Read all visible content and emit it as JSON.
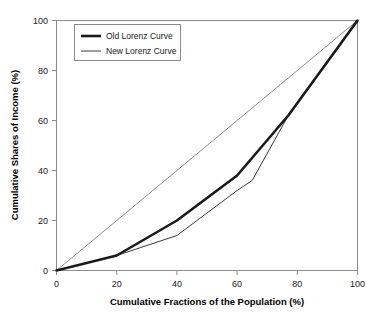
{
  "chart_data": {
    "type": "line",
    "title": "",
    "xlabel": "Cumulative Fractions of the Population (%)",
    "ylabel": "Cumulative Shares of Income (%)",
    "xlim": [
      0,
      100
    ],
    "ylim": [
      0,
      100
    ],
    "xticks": [
      0,
      20,
      40,
      60,
      80,
      100
    ],
    "yticks": [
      0,
      20,
      40,
      60,
      80,
      100
    ],
    "xtick_labels": [
      "0",
      "20",
      "40",
      "60",
      "80",
      "100"
    ],
    "ytick_labels": [
      "0",
      "20",
      "40",
      "60",
      "80",
      "100"
    ],
    "grid": false,
    "legend_position": "upper-left",
    "series": [
      {
        "name": "Old Lorenz Curve",
        "style": "thick",
        "color": "#1a1a1a",
        "width": 2.6,
        "x": [
          0,
          20,
          40,
          60,
          77,
          100
        ],
        "y": [
          0,
          6,
          20,
          38,
          62,
          100
        ]
      },
      {
        "name": "New Lorenz Curve",
        "style": "thin",
        "color": "#3a3a3a",
        "width": 1.0,
        "x": [
          0,
          20,
          40,
          60,
          65,
          77,
          100
        ],
        "y": [
          0,
          6,
          14,
          32,
          36,
          62,
          100
        ]
      },
      {
        "name": "Line of Equality",
        "style": "thin-reference",
        "color": "#6e6e6e",
        "width": 0.8,
        "x": [
          0,
          100
        ],
        "y": [
          0,
          100
        ]
      }
    ]
  },
  "legend": {
    "entries": [
      {
        "label": "Old Lorenz Curve"
      },
      {
        "label": "New Lorenz Curve"
      }
    ]
  },
  "axes": {
    "x_title": "Cumulative Fractions of the Population (%)",
    "y_title": "Cumulative Shares of Income (%)"
  },
  "colors": {
    "background": "#ffffff",
    "frame": "#8c8c8c",
    "thick_series": "#1a1a1a",
    "thin_series": "#3a3a3a",
    "equality_line": "#6e6e6e",
    "text": "#1a1a1a"
  }
}
